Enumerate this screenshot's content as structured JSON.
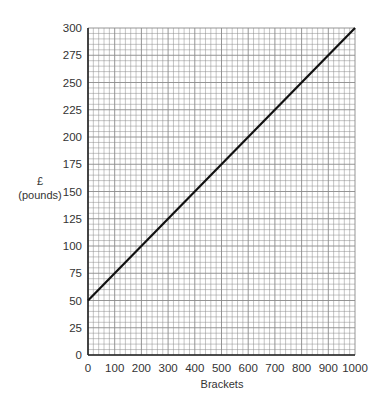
{
  "chart_data": {
    "type": "line",
    "title": "",
    "xlabel": "Brackets",
    "ylabel": "£ (pounds)",
    "ylabel_lines": [
      "£",
      "(pounds)"
    ],
    "xlim": [
      0,
      1000
    ],
    "ylim": [
      0,
      300
    ],
    "x_ticks": [
      0,
      100,
      200,
      300,
      400,
      500,
      600,
      700,
      800,
      900,
      1000
    ],
    "y_ticks": [
      0,
      25,
      50,
      75,
      100,
      125,
      150,
      175,
      200,
      225,
      250,
      275,
      300
    ],
    "grid": true,
    "grid_minor_per_major": 5,
    "legend": null,
    "series": [
      {
        "name": "cost",
        "x": [
          0,
          1000
        ],
        "y": [
          50,
          300
        ],
        "color": "#111111"
      }
    ]
  },
  "colors": {
    "grid": "#8a8a8a",
    "axis": "#222222",
    "line": "#111111"
  }
}
